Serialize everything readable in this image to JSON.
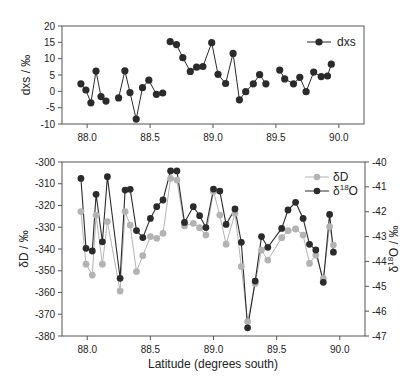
{
  "chart_data": [
    {
      "type": "line",
      "title": "",
      "xlabel": "",
      "ylabel": "dxs  /  ‰",
      "xlim": [
        87.8,
        90.2
      ],
      "ylim": [
        -10,
        20
      ],
      "x_ticks": [
        "88.0",
        "88.5",
        "89.0",
        "89.5",
        "90.0"
      ],
      "x_tick_values": [
        88.0,
        88.5,
        89.0,
        89.5,
        90.0
      ],
      "y_ticks": [
        "-10",
        "-5",
        "0",
        "5",
        "10",
        "15",
        "20"
      ],
      "y_tick_values": [
        -10,
        -5,
        0,
        5,
        10,
        15,
        20
      ],
      "grid": false,
      "legend_position": "upper right",
      "segments_break_after_x": [
        88.15,
        88.6,
        89.42
      ],
      "series": [
        {
          "name": "dxs",
          "color": "#2b2b2b",
          "marker": "circle",
          "x": [
            87.95,
            87.99,
            88.03,
            88.07,
            88.11,
            88.15,
            88.25,
            88.3,
            88.34,
            88.39,
            88.44,
            88.49,
            88.55,
            88.6,
            88.66,
            88.71,
            88.76,
            88.82,
            88.87,
            88.92,
            88.99,
            89.04,
            89.1,
            89.16,
            89.21,
            89.26,
            89.32,
            89.37,
            89.42,
            89.53,
            89.57,
            89.64,
            89.69,
            89.74,
            89.8,
            89.86,
            89.91,
            89.94
          ],
          "values": [
            2.3,
            0.4,
            -3.5,
            6.2,
            -1.6,
            -3.0,
            -2.0,
            6.3,
            -0.4,
            -8.5,
            1.1,
            3.4,
            -0.9,
            -0.5,
            15.2,
            14.3,
            10.3,
            6.1,
            7.4,
            7.6,
            14.9,
            5.2,
            2.4,
            11.6,
            -2.6,
            -0.1,
            2.3,
            5.1,
            2.3,
            6.5,
            3.8,
            2.3,
            4.3,
            -0.1,
            5.9,
            4.5,
            4.7,
            8.3
          ]
        }
      ]
    },
    {
      "type": "line",
      "title": "",
      "xlabel": "Latitude (degrees south)",
      "ylabel": "δD  /  ‰",
      "ylabel_right": "δ18O  /  ‰",
      "xlim": [
        87.8,
        90.2
      ],
      "ylim": [
        -380,
        -300
      ],
      "ylim_right": [
        -47,
        -40
      ],
      "x_ticks": [
        "88.0",
        "88.5",
        "89.0",
        "89.5",
        "90.0"
      ],
      "x_tick_values": [
        88.0,
        88.5,
        89.0,
        89.5,
        90.0
      ],
      "y_ticks": [
        "-380",
        "-370",
        "-360",
        "-350",
        "-340",
        "-330",
        "-320",
        "-310",
        "-300"
      ],
      "y_tick_values": [
        -380,
        -370,
        -360,
        -350,
        -340,
        -330,
        -320,
        -310,
        -300
      ],
      "y_ticks_right": [
        "-47",
        "-46",
        "-45",
        "-44",
        "-43",
        "-42",
        "-41",
        "-40"
      ],
      "y_tick_values_right": [
        -47,
        -46,
        -45,
        -44,
        -43,
        -42,
        -41,
        -40
      ],
      "grid": false,
      "legend_position": "upper right",
      "segments_break_after_x": [
        88.15,
        89.42
      ],
      "x": [
        87.95,
        87.99,
        88.04,
        88.07,
        88.12,
        88.16,
        88.26,
        88.3,
        88.34,
        88.39,
        88.44,
        88.5,
        88.55,
        88.6,
        88.66,
        88.71,
        88.77,
        88.84,
        88.89,
        88.94,
        89.0,
        89.05,
        89.1,
        89.17,
        89.22,
        89.27,
        89.33,
        89.38,
        89.43,
        89.54,
        89.59,
        89.65,
        89.71,
        89.76,
        89.81,
        89.87,
        89.92,
        89.95
      ],
      "series": [
        {
          "name": "δD",
          "axis": "left",
          "color": "#b3b3b3",
          "marker": "circle",
          "values": [
            -322.8,
            -347.0,
            -352.0,
            -324.4,
            -347.0,
            -327.4,
            -359.3,
            -322.8,
            -329.0,
            -350.4,
            -343.1,
            -334.3,
            -335.1,
            -332.8,
            -307.5,
            -308.3,
            -329.4,
            -328.2,
            -330.2,
            -333.6,
            -313.6,
            -324.4,
            -337.8,
            -323.6,
            -348.1,
            -373.4,
            -355.8,
            -340.5,
            -345.1,
            -334.8,
            -331.6,
            -330.8,
            -333.6,
            -346.6,
            -342.8,
            -353.5,
            -329.7,
            -338.2
          ]
        },
        {
          "name": "δ18O",
          "axis": "right",
          "color": "#2b2b2b",
          "marker": "circle",
          "values": [
            -40.66,
            -43.47,
            -43.58,
            -41.3,
            -43.21,
            -40.59,
            -44.68,
            -41.13,
            -41.1,
            -42.76,
            -43.04,
            -42.27,
            -41.8,
            -41.53,
            -40.36,
            -40.36,
            -42.43,
            -41.8,
            -42.16,
            -42.64,
            -41.09,
            -41.17,
            -42.51,
            -41.89,
            -43.23,
            -46.67,
            -44.79,
            -43.0,
            -43.43,
            -42.67,
            -41.93,
            -41.62,
            -42.27,
            -43.31,
            -43.54,
            -44.84,
            -42.11,
            -43.63
          ]
        }
      ]
    }
  ],
  "top_panel": {
    "ylabel": "dxs  /  ‰",
    "legend": [
      {
        "label": "dxs"
      }
    ]
  },
  "bottom_panel": {
    "ylabel_left": "δD  /  ‰",
    "ylabel_right_delta": "δ",
    "ylabel_right_sup": "18",
    "ylabel_right_rest": "O  /  ‰",
    "xlabel": "Latitude (degrees south)",
    "legend": [
      {
        "label": "δD"
      },
      {
        "label_delta": "δ",
        "label_sup": "18",
        "label_rest": "O"
      }
    ]
  }
}
